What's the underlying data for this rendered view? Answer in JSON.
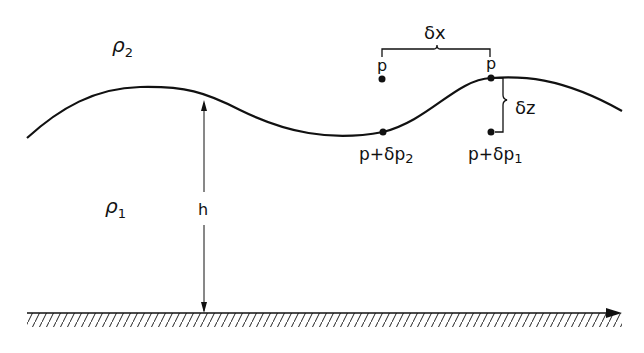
{
  "labels": {
    "rho2": "ρ",
    "rho2_sub": "2",
    "rho1": "ρ",
    "rho1_sub": "1",
    "h": "h",
    "delta_x": "δx",
    "delta_z": "δz",
    "p_left": "p",
    "p_right": "p",
    "p_dp2": "p+δp",
    "p_dp2_sub": "2",
    "p_dp1": "p+δp",
    "p_dp1_sub": "1"
  },
  "colors": {
    "ink": "#111111",
    "background": "#ffffff"
  }
}
